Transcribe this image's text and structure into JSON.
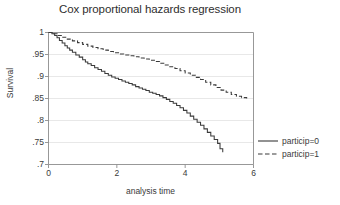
{
  "chart_data": {
    "type": "line",
    "title": "Cox proportional hazards regression",
    "xlabel": "analysis time",
    "ylabel": "Survival",
    "xlim": [
      0,
      6
    ],
    "ylim": [
      0.7,
      1.0
    ],
    "xticks": [
      "0",
      "2",
      "4",
      "6"
    ],
    "xtick_values": [
      0,
      2,
      4,
      6
    ],
    "yticks": [
      "1",
      ".95",
      ".9",
      ".85",
      ".8",
      ".75",
      ".7"
    ],
    "ytick_values": [
      1,
      0.95,
      0.9,
      0.85,
      0.8,
      0.75,
      0.7
    ],
    "grid": "horizontal",
    "legend_position": "right-middle",
    "series": [
      {
        "name": "particip=0",
        "style": "solid",
        "color": "#3a3a3a",
        "x": [
          0.0,
          0.1,
          0.18,
          0.25,
          0.32,
          0.4,
          0.48,
          0.55,
          0.62,
          0.7,
          0.8,
          0.9,
          1.0,
          1.08,
          1.15,
          1.25,
          1.35,
          1.45,
          1.55,
          1.65,
          1.75,
          1.85,
          1.95,
          2.05,
          2.15,
          2.25,
          2.35,
          2.45,
          2.55,
          2.65,
          2.75,
          2.85,
          2.95,
          3.05,
          3.15,
          3.25,
          3.35,
          3.45,
          3.55,
          3.65,
          3.75,
          3.85,
          3.95,
          4.05,
          4.15,
          4.25,
          4.35,
          4.45,
          4.55,
          4.65,
          4.75,
          4.85,
          4.95,
          5.02,
          5.1
        ],
        "y": [
          1.0,
          0.997,
          0.993,
          0.988,
          0.982,
          0.976,
          0.97,
          0.965,
          0.96,
          0.955,
          0.949,
          0.944,
          0.938,
          0.933,
          0.929,
          0.925,
          0.92,
          0.916,
          0.912,
          0.907,
          0.903,
          0.899,
          0.896,
          0.893,
          0.89,
          0.887,
          0.884,
          0.881,
          0.877,
          0.874,
          0.871,
          0.868,
          0.864,
          0.862,
          0.859,
          0.856,
          0.852,
          0.848,
          0.843,
          0.839,
          0.834,
          0.829,
          0.823,
          0.817,
          0.81,
          0.803,
          0.796,
          0.789,
          0.781,
          0.773,
          0.765,
          0.757,
          0.748,
          0.736,
          0.728
        ]
      },
      {
        "name": "particip=1",
        "style": "dashed",
        "color": "#3a3a3a",
        "x": [
          0.0,
          0.12,
          0.25,
          0.4,
          0.55,
          0.7,
          0.85,
          1.0,
          1.15,
          1.3,
          1.45,
          1.6,
          1.75,
          1.9,
          2.05,
          2.2,
          2.35,
          2.5,
          2.65,
          2.8,
          2.95,
          3.1,
          3.25,
          3.4,
          3.55,
          3.7,
          3.85,
          4.0,
          4.15,
          4.3,
          4.45,
          4.6,
          4.75,
          4.9,
          5.05,
          5.2,
          5.35,
          5.5,
          5.65,
          5.8
        ],
        "y": [
          1.0,
          0.997,
          0.993,
          0.989,
          0.985,
          0.981,
          0.977,
          0.973,
          0.969,
          0.966,
          0.963,
          0.96,
          0.957,
          0.954,
          0.951,
          0.949,
          0.947,
          0.945,
          0.942,
          0.94,
          0.937,
          0.934,
          0.93,
          0.926,
          0.922,
          0.918,
          0.913,
          0.908,
          0.903,
          0.898,
          0.893,
          0.887,
          0.881,
          0.875,
          0.869,
          0.864,
          0.859,
          0.855,
          0.852,
          0.85
        ]
      }
    ]
  },
  "legend": {
    "items": [
      {
        "label": "particip=0",
        "style": "solid"
      },
      {
        "label": "particip=1",
        "style": "dashed"
      }
    ]
  }
}
